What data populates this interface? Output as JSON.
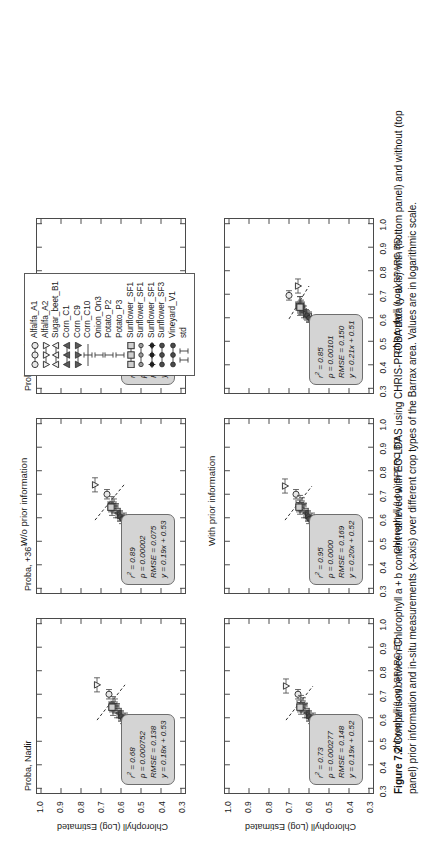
{
  "figure": {
    "number": "Figure 7.2",
    "caption": "Comparison between Chlorophyll a + b content retrieved with EO-LDAS using CHRIS-PROBA data (y-axis) with (bottom panel) and without (top panel) prior information and in-situ measurements (x-axis) over different crop types of the Barrax area. Values are in logarithmic scale."
  },
  "row_labels": {
    "top": "W/o prior information",
    "bottom": "With prior information"
  },
  "axes": {
    "xlabel": "Chlorophyll (Log) SPARC BD",
    "ylabel": "Chlorophyll (Log) Estimated",
    "xticks": [
      "0.3",
      "0.4",
      "0.5",
      "0.6",
      "0.7",
      "0.8",
      "0.9",
      "1.0"
    ],
    "yticks": [
      "0.3",
      "0.4",
      "0.5",
      "0.6",
      "0.7",
      "0.8",
      "0.9",
      "1.0"
    ],
    "xlim": [
      0.28,
      1.02
    ],
    "ylim": [
      0.28,
      1.02
    ]
  },
  "panels": [
    {
      "id": "nadir-top",
      "title": "Proba, Nadir",
      "stats": {
        "r2": "0.68",
        "p": "0.000752",
        "rmse": "0.138",
        "eq": "y = 0.18x + 0.53"
      },
      "fit": {
        "slope": 0.18,
        "intercept": 0.53
      }
    },
    {
      "id": "p36-top",
      "title": "Proba, +36°",
      "stats": {
        "r2": "0.89",
        "p": "0.00002",
        "rmse": "0.075",
        "eq": "y = 0.19x + 0.53"
      },
      "fit": {
        "slope": 0.19,
        "intercept": 0.53
      }
    },
    {
      "id": "p55-top",
      "title": "Proba, +55°",
      "stats": {
        "r2": "0.88",
        "p": "0.00042",
        "rmse": "0.193",
        "eq": "y = 0.18x + 0.52"
      },
      "fit": {
        "slope": 0.18,
        "intercept": 0.52
      }
    },
    {
      "id": "nadir-bottom",
      "title": "",
      "stats": {
        "r2": "0.73",
        "p": "0.000277",
        "rmse": "0.148",
        "eq": "y = 0.19x + 0.52"
      },
      "fit": {
        "slope": 0.19,
        "intercept": 0.52
      }
    },
    {
      "id": "p36-bottom",
      "title": "",
      "stats": {
        "r2": "0.95",
        "p": "0.0000",
        "rmse": "0.169",
        "eq": "y = 0.20x + 0.52"
      },
      "fit": {
        "slope": 0.2,
        "intercept": 0.52
      }
    },
    {
      "id": "p55-bottom",
      "title": "",
      "stats": {
        "r2": "0.85",
        "p": "0.00101",
        "rmse": "0.150",
        "eq": "y = 0.21x + 0.51"
      },
      "fit": {
        "slope": 0.21,
        "intercept": 0.51
      }
    }
  ],
  "legend": {
    "items": [
      {
        "label": "Alfalfa_A1",
        "marker": "circle-open",
        "line": true
      },
      {
        "label": "Alfalfa_A2",
        "marker": "tri-down-open",
        "line": true
      },
      {
        "label": "Sugar_beet_B1",
        "marker": "tri-up-open",
        "line": true
      },
      {
        "label": "Corn_C1",
        "marker": "tri-up-fill",
        "line": true
      },
      {
        "label": "Corn_C9",
        "marker": "tri-down-fill",
        "line": true
      },
      {
        "label": "Corn_C10",
        "marker": "errbar",
        "line": true
      },
      {
        "label": "Onion_On3",
        "marker": "errbar",
        "line": false
      },
      {
        "label": "Potato_P2",
        "marker": "errbar",
        "line": false
      },
      {
        "label": "Potato_P3",
        "marker": "errbar",
        "line": false
      },
      {
        "label": "Sunflower_SF1",
        "marker": "square-open",
        "line": true
      },
      {
        "label": "Sunflower_SF1",
        "marker": "circle-small",
        "line": true
      },
      {
        "label": "Sunflower_SF1",
        "marker": "star-fill",
        "line": true
      },
      {
        "label": "Sunflower_SF3",
        "marker": "circle-fill",
        "line": true
      },
      {
        "label": "Vineyard_V1",
        "marker": "circle-fill",
        "line": true
      },
      {
        "label": "std",
        "marker": "std",
        "line": false
      }
    ]
  },
  "chart_data": {
    "type": "scatter",
    "xlabel": "Chlorophyll (Log) SPARC BD",
    "ylabel": "Chlorophyll (Log) Estimated",
    "xlim": [
      0.28,
      1.02
    ],
    "ylim": [
      0.28,
      1.02
    ],
    "grid": false,
    "legend_position": "top-right",
    "scale": "logarithmic",
    "panels": [
      {
        "name": "Proba, Nadir / W/o prior information",
        "r2": 0.68,
        "p": 0.000752,
        "rmse": 0.138,
        "slope": 0.18,
        "intercept": 0.53,
        "points": [
          {
            "label": "Alfalfa_A1",
            "x": 0.7,
            "y": 0.66,
            "xerr": 0.02,
            "yerr": 0.0
          },
          {
            "label": "Alfalfa_A2",
            "x": 0.74,
            "y": 0.72,
            "xerr": 0.03,
            "yerr": 0.0
          },
          {
            "label": "Sugar_beet_B1",
            "x": 0.6,
            "y": 0.58,
            "xerr": 0.02,
            "yerr": 0.0
          },
          {
            "label": "Corn_C1",
            "x": 0.62,
            "y": 0.61,
            "xerr": 0.02,
            "yerr": 0.0
          },
          {
            "label": "Corn_C9",
            "x": 0.61,
            "y": 0.6,
            "xerr": 0.02,
            "yerr": 0.0
          },
          {
            "label": "Corn_C10",
            "x": 0.63,
            "y": 0.62,
            "xerr": 0.03,
            "yerr": 0.0
          },
          {
            "label": "Onion_On3",
            "x": 0.64,
            "y": 0.64,
            "xerr": 0.03,
            "yerr": 0.0
          },
          {
            "label": "Potato_P2",
            "x": 0.65,
            "y": 0.63,
            "xerr": 0.03,
            "yerr": 0.0
          },
          {
            "label": "Potato_P3",
            "x": 0.66,
            "y": 0.64,
            "xerr": 0.03,
            "yerr": 0.0
          },
          {
            "label": "Sunflower_SF1",
            "x": 0.645,
            "y": 0.645,
            "xerr": 0.02,
            "yerr": 0.0
          },
          {
            "label": "Sunflower_SF3",
            "x": 0.605,
            "y": 0.6,
            "xerr": 0.02,
            "yerr": 0.0
          },
          {
            "label": "Vineyard_V1",
            "x": 0.595,
            "y": 0.59,
            "xerr": 0.02,
            "yerr": 0.0
          }
        ]
      },
      {
        "name": "Proba, +36° / W/o prior information",
        "r2": 0.89,
        "p": 2e-05,
        "rmse": 0.075,
        "slope": 0.19,
        "intercept": 0.53,
        "points": [
          {
            "label": "Alfalfa_A1",
            "x": 0.7,
            "y": 0.67,
            "xerr": 0.02,
            "yerr": 0.0
          },
          {
            "label": "Alfalfa_A2",
            "x": 0.74,
            "y": 0.73,
            "xerr": 0.03,
            "yerr": 0.0
          },
          {
            "label": "Sugar_beet_B1",
            "x": 0.6,
            "y": 0.585,
            "xerr": 0.02,
            "yerr": 0.0
          },
          {
            "label": "Corn_C1",
            "x": 0.62,
            "y": 0.615,
            "xerr": 0.02,
            "yerr": 0.0
          },
          {
            "label": "Corn_C9",
            "x": 0.61,
            "y": 0.605,
            "xerr": 0.02,
            "yerr": 0.0
          },
          {
            "label": "Corn_C10",
            "x": 0.63,
            "y": 0.625,
            "xerr": 0.03,
            "yerr": 0.0
          },
          {
            "label": "Onion_On3",
            "x": 0.64,
            "y": 0.645,
            "xerr": 0.03,
            "yerr": 0.0
          },
          {
            "label": "Potato_P2",
            "x": 0.65,
            "y": 0.635,
            "xerr": 0.03,
            "yerr": 0.0
          },
          {
            "label": "Potato_P3",
            "x": 0.66,
            "y": 0.645,
            "xerr": 0.03,
            "yerr": 0.0
          },
          {
            "label": "Sunflower_SF1",
            "x": 0.645,
            "y": 0.65,
            "xerr": 0.02,
            "yerr": 0.0
          },
          {
            "label": "Sunflower_SF3",
            "x": 0.605,
            "y": 0.605,
            "xerr": 0.02,
            "yerr": 0.0
          },
          {
            "label": "Vineyard_V1",
            "x": 0.595,
            "y": 0.595,
            "xerr": 0.02,
            "yerr": 0.0
          }
        ]
      },
      {
        "name": "Proba, +55° / W/o prior information",
        "r2": 0.88,
        "p": 0.00042,
        "rmse": 0.193,
        "slope": 0.18,
        "intercept": 0.52,
        "points": [
          {
            "label": "Alfalfa_A1",
            "x": 0.695,
            "y": 0.66,
            "xerr": 0.02,
            "yerr": 0.0
          },
          {
            "label": "Alfalfa_A2",
            "x": 0.735,
            "y": 0.72,
            "xerr": 0.03,
            "yerr": 0.0
          },
          {
            "label": "Sugar_beet_B1",
            "x": 0.6,
            "y": 0.575,
            "xerr": 0.02,
            "yerr": 0.0
          },
          {
            "label": "Corn_C1",
            "x": 0.62,
            "y": 0.605,
            "xerr": 0.02,
            "yerr": 0.0
          },
          {
            "label": "Corn_C9",
            "x": 0.61,
            "y": 0.595,
            "xerr": 0.02,
            "yerr": 0.0
          },
          {
            "label": "Corn_C10",
            "x": 0.63,
            "y": 0.615,
            "xerr": 0.03,
            "yerr": 0.0
          },
          {
            "label": "Onion_On3",
            "x": 0.64,
            "y": 0.635,
            "xerr": 0.03,
            "yerr": 0.0
          },
          {
            "label": "Potato_P2",
            "x": 0.65,
            "y": 0.625,
            "xerr": 0.03,
            "yerr": 0.0
          },
          {
            "label": "Potato_P3",
            "x": 0.66,
            "y": 0.635,
            "xerr": 0.03,
            "yerr": 0.0
          },
          {
            "label": "Sunflower_SF1",
            "x": 0.645,
            "y": 0.64,
            "xerr": 0.02,
            "yerr": 0.0
          },
          {
            "label": "Sunflower_SF3",
            "x": 0.605,
            "y": 0.595,
            "xerr": 0.02,
            "yerr": 0.0
          },
          {
            "label": "Vineyard_V1",
            "x": 0.595,
            "y": 0.585,
            "xerr": 0.02,
            "yerr": 0.0
          }
        ]
      },
      {
        "name": "Proba, Nadir / With prior information",
        "r2": 0.73,
        "p": 0.000277,
        "rmse": 0.148,
        "slope": 0.19,
        "intercept": 0.52,
        "points": [
          {
            "label": "Alfalfa_A1",
            "x": 0.7,
            "y": 0.655,
            "xerr": 0.02,
            "yerr": 0.0
          },
          {
            "label": "Alfalfa_A2",
            "x": 0.735,
            "y": 0.715,
            "xerr": 0.03,
            "yerr": 0.0
          },
          {
            "label": "Sugar_beet_B1",
            "x": 0.6,
            "y": 0.58,
            "xerr": 0.02,
            "yerr": 0.0
          },
          {
            "label": "Corn_C1",
            "x": 0.62,
            "y": 0.61,
            "xerr": 0.02,
            "yerr": 0.0
          },
          {
            "label": "Corn_C9",
            "x": 0.61,
            "y": 0.6,
            "xerr": 0.02,
            "yerr": 0.0
          },
          {
            "label": "Corn_C10",
            "x": 0.63,
            "y": 0.62,
            "xerr": 0.03,
            "yerr": 0.0
          },
          {
            "label": "Onion_On3",
            "x": 0.645,
            "y": 0.64,
            "xerr": 0.03,
            "yerr": 0.0
          },
          {
            "label": "Potato_P2",
            "x": 0.655,
            "y": 0.63,
            "xerr": 0.03,
            "yerr": 0.0
          },
          {
            "label": "Potato_P3",
            "x": 0.665,
            "y": 0.64,
            "xerr": 0.03,
            "yerr": 0.0
          },
          {
            "label": "Sunflower_SF1",
            "x": 0.645,
            "y": 0.645,
            "xerr": 0.02,
            "yerr": 0.0
          },
          {
            "label": "Sunflower_SF3",
            "x": 0.605,
            "y": 0.6,
            "xerr": 0.02,
            "yerr": 0.0
          },
          {
            "label": "Vineyard_V1",
            "x": 0.595,
            "y": 0.59,
            "xerr": 0.02,
            "yerr": 0.0
          }
        ]
      },
      {
        "name": "Proba, +36° / With prior information",
        "r2": 0.95,
        "p": 0.0,
        "rmse": 0.169,
        "slope": 0.2,
        "intercept": 0.52,
        "points": [
          {
            "label": "Alfalfa_A1",
            "x": 0.7,
            "y": 0.665,
            "xerr": 0.02,
            "yerr": 0.0
          },
          {
            "label": "Alfalfa_A2",
            "x": 0.735,
            "y": 0.72,
            "xerr": 0.03,
            "yerr": 0.0
          },
          {
            "label": "Sugar_beet_B1",
            "x": 0.6,
            "y": 0.585,
            "xerr": 0.02,
            "yerr": 0.0
          },
          {
            "label": "Corn_C1",
            "x": 0.62,
            "y": 0.615,
            "xerr": 0.02,
            "yerr": 0.0
          },
          {
            "label": "Corn_C9",
            "x": 0.61,
            "y": 0.605,
            "xerr": 0.02,
            "yerr": 0.0
          },
          {
            "label": "Corn_C10",
            "x": 0.63,
            "y": 0.625,
            "xerr": 0.03,
            "yerr": 0.0
          },
          {
            "label": "Onion_On3",
            "x": 0.645,
            "y": 0.645,
            "xerr": 0.03,
            "yerr": 0.0
          },
          {
            "label": "Potato_P2",
            "x": 0.655,
            "y": 0.635,
            "xerr": 0.03,
            "yerr": 0.0
          },
          {
            "label": "Potato_P3",
            "x": 0.665,
            "y": 0.645,
            "xerr": 0.03,
            "yerr": 0.0
          },
          {
            "label": "Sunflower_SF1",
            "x": 0.645,
            "y": 0.65,
            "xerr": 0.02,
            "yerr": 0.0
          },
          {
            "label": "Sunflower_SF3",
            "x": 0.605,
            "y": 0.605,
            "xerr": 0.02,
            "yerr": 0.0
          },
          {
            "label": "Vineyard_V1",
            "x": 0.595,
            "y": 0.6,
            "xerr": 0.02,
            "yerr": 0.0
          }
        ]
      },
      {
        "name": "Proba, +55° / With prior information",
        "r2": 0.85,
        "p": 0.00101,
        "rmse": 0.15,
        "slope": 0.21,
        "intercept": 0.51,
        "points": [
          {
            "label": "Alfalfa_A1",
            "x": 0.695,
            "y": 0.7,
            "xerr": 0.02,
            "yerr": 0.0
          },
          {
            "label": "Alfalfa_A2",
            "x": 0.735,
            "y": 0.655,
            "xerr": 0.03,
            "yerr": 0.0
          },
          {
            "label": "Sugar_beet_B1",
            "x": 0.605,
            "y": 0.6,
            "xerr": 0.02,
            "yerr": 0.0
          },
          {
            "label": "Corn_C1",
            "x": 0.625,
            "y": 0.625,
            "xerr": 0.025,
            "yerr": 0.0
          },
          {
            "label": "Corn_C9",
            "x": 0.615,
            "y": 0.615,
            "xerr": 0.02,
            "yerr": 0.0
          },
          {
            "label": "Corn_C10",
            "x": 0.64,
            "y": 0.645,
            "xerr": 0.03,
            "yerr": 0.0
          },
          {
            "label": "Onion_On3",
            "x": 0.655,
            "y": 0.645,
            "xerr": 0.035,
            "yerr": 0.0
          },
          {
            "label": "Potato_P2",
            "x": 0.645,
            "y": 0.64,
            "xerr": 0.03,
            "yerr": 0.0
          },
          {
            "label": "Potato_P3",
            "x": 0.66,
            "y": 0.645,
            "xerr": 0.03,
            "yerr": 0.0
          },
          {
            "label": "Sunflower_SF1",
            "x": 0.645,
            "y": 0.645,
            "xerr": 0.02,
            "yerr": 0.0
          },
          {
            "label": "Sunflower_SF3",
            "x": 0.61,
            "y": 0.61,
            "xerr": 0.02,
            "yerr": 0.0
          },
          {
            "label": "Vineyard_V1",
            "x": 0.6,
            "y": 0.6,
            "xerr": 0.02,
            "yerr": 0.0
          }
        ]
      }
    ]
  }
}
